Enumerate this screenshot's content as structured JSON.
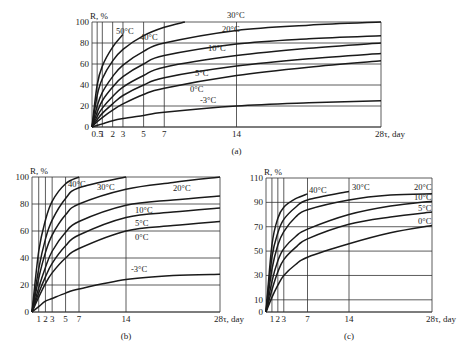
{
  "chart_data": [
    {
      "id": "a",
      "type": "line",
      "caption": "(a)",
      "ylabel": "R, %",
      "xlabel": "τ, day",
      "ylim": [
        0,
        100
      ],
      "xlim": [
        0,
        28
      ],
      "yticks": [
        0,
        20,
        40,
        60,
        80,
        100
      ],
      "xticks": [
        0.5,
        1,
        2,
        3,
        5,
        7,
        14,
        28
      ],
      "xtick_labels": [
        "0.5",
        "1",
        "2",
        "3",
        "5",
        "7",
        "14",
        "28τ, day"
      ],
      "box": {
        "x0": 92,
        "x1": 381,
        "y0": 127,
        "y1": 22
      },
      "series": [
        {
          "name": "50°C",
          "x": [
            0,
            0.5,
            1,
            2,
            3
          ],
          "values": [
            0,
            40,
            58,
            76,
            88
          ],
          "label_at": [
            116,
            34
          ]
        },
        {
          "name": "40°C",
          "x": [
            0,
            0.5,
            1,
            2,
            3,
            5,
            7,
            9
          ],
          "values": [
            0,
            30,
            46,
            63,
            74,
            87,
            95,
            100
          ],
          "label_at": [
            140,
            40
          ]
        },
        {
          "name": "30°C",
          "x": [
            0,
            0.5,
            1,
            2,
            3,
            5,
            7,
            14,
            21,
            28
          ],
          "values": [
            0,
            20,
            33,
            48,
            59,
            72,
            80,
            92,
            97,
            100
          ],
          "label_at": [
            227,
            18
          ]
        },
        {
          "name": "20°C",
          "x": [
            0,
            0.5,
            1,
            2,
            3,
            5,
            7,
            14,
            21,
            28
          ],
          "values": [
            0,
            14,
            25,
            38,
            48,
            60,
            68,
            79,
            84,
            87
          ],
          "label_at": [
            222,
            32
          ]
        },
        {
          "name": "10°C",
          "x": [
            0,
            0.5,
            1,
            2,
            3,
            5,
            7,
            14,
            21,
            28
          ],
          "values": [
            0,
            10,
            18,
            29,
            38,
            49,
            57,
            68,
            75,
            80
          ],
          "label_at": [
            208,
            51
          ]
        },
        {
          "name": "5°C",
          "x": [
            0,
            0.5,
            1,
            2,
            3,
            5,
            7,
            14,
            21,
            28
          ],
          "values": [
            0,
            7,
            13,
            22,
            30,
            40,
            47,
            58,
            65,
            70
          ],
          "label_at": [
            195,
            76
          ]
        },
        {
          "name": "0°C",
          "x": [
            0,
            0.5,
            1,
            2,
            3,
            5,
            7,
            14,
            21,
            28
          ],
          "values": [
            0,
            5,
            9,
            16,
            22,
            31,
            37,
            49,
            57,
            63
          ],
          "label_at": [
            190,
            92
          ]
        },
        {
          "name": "-3°C",
          "x": [
            0,
            1,
            2,
            3,
            5,
            7,
            14,
            21,
            28
          ],
          "values": [
            0,
            3,
            6,
            8,
            11,
            14,
            20,
            23,
            25
          ],
          "label_at": [
            200,
            103
          ]
        }
      ]
    },
    {
      "id": "b",
      "type": "line",
      "caption": "(b)",
      "ylabel": "R, %",
      "xlabel": "τ, day",
      "ylim": [
        0,
        100
      ],
      "xlim": [
        0,
        28
      ],
      "yticks": [
        0,
        20,
        40,
        60,
        80,
        100
      ],
      "xticks": [
        1,
        2,
        3,
        5,
        7,
        14,
        28
      ],
      "xtick_labels": [
        "1",
        "2",
        "3",
        "5",
        "7",
        "14",
        "28τ, day"
      ],
      "box": {
        "x0": 32,
        "x1": 220,
        "y0": 312,
        "y1": 177
      },
      "series": [
        {
          "name": "40°C",
          "x": [
            0,
            1,
            2,
            3,
            5,
            7
          ],
          "values": [
            0,
            45,
            68,
            82,
            95,
            100
          ],
          "label_at": [
            68,
            187
          ]
        },
        {
          "name": "30°C",
          "x": [
            0,
            1,
            2,
            3,
            5,
            7,
            14
          ],
          "values": [
            0,
            32,
            54,
            68,
            84,
            92,
            100
          ],
          "label_at": [
            97,
            190
          ]
        },
        {
          "name": "20°C",
          "x": [
            0,
            1,
            2,
            3,
            5,
            7,
            14,
            21,
            28
          ],
          "values": [
            0,
            25,
            44,
            57,
            72,
            80,
            91,
            96,
            100
          ],
          "label_at": [
            173,
            191
          ]
        },
        {
          "name": "10°C",
          "x": [
            0,
            1,
            2,
            3,
            5,
            7,
            14,
            21,
            28
          ],
          "values": [
            0,
            18,
            33,
            45,
            59,
            67,
            79,
            83,
            86
          ],
          "label_at": [
            135,
            213
          ]
        },
        {
          "name": "5°C",
          "x": [
            0,
            1,
            2,
            3,
            5,
            7,
            14,
            21,
            28
          ],
          "values": [
            0,
            14,
            26,
            36,
            49,
            57,
            70,
            74,
            77
          ],
          "label_at": [
            135,
            226
          ]
        },
        {
          "name": "0°C",
          "x": [
            0,
            1,
            2,
            3,
            5,
            7,
            14,
            21,
            28
          ],
          "values": [
            0,
            11,
            21,
            29,
            40,
            47,
            60,
            64,
            67
          ],
          "label_at": [
            135,
            240
          ]
        },
        {
          "name": "-3°C",
          "x": [
            0,
            1,
            2,
            3,
            5,
            7,
            14,
            21,
            28
          ],
          "values": [
            0,
            4,
            8,
            10,
            14,
            17,
            24,
            27,
            28
          ],
          "label_at": [
            131,
            272
          ]
        }
      ]
    },
    {
      "id": "c",
      "type": "line",
      "caption": "(c)",
      "ylabel": "R, %",
      "xlabel": "τ, day",
      "ylim": [
        0,
        110
      ],
      "xlim": [
        0,
        28
      ],
      "yticks": [
        0,
        10,
        30,
        50,
        70,
        90,
        110
      ],
      "xticks": [
        1,
        2,
        3,
        7,
        14,
        28
      ],
      "xtick_labels": [
        "1",
        "2",
        "3",
        "7",
        "14",
        "28τ, day"
      ],
      "box": {
        "x0": 266,
        "x1": 432,
        "y0": 312,
        "y1": 178
      },
      "series": [
        {
          "name": "40°C",
          "x": [
            0,
            1,
            2,
            3,
            5,
            7
          ],
          "values": [
            0,
            55,
            77,
            86,
            93,
            97
          ],
          "label_at": [
            309,
            193
          ]
        },
        {
          "name": "30°C",
          "x": [
            0,
            1,
            2,
            3,
            5,
            7,
            14
          ],
          "values": [
            0,
            45,
            65,
            76,
            86,
            92,
            99
          ],
          "label_at": [
            352,
            190
          ]
        },
        {
          "name": "20°C",
          "x": [
            0,
            1,
            2,
            3,
            5,
            7,
            14,
            21,
            28
          ],
          "values": [
            0,
            35,
            55,
            66,
            78,
            84,
            92,
            96,
            97
          ],
          "label_at": [
            414,
            190
          ]
        },
        {
          "name": "10°C",
          "x": [
            0,
            1,
            2,
            3,
            5,
            7,
            14,
            21,
            28
          ],
          "values": [
            0,
            25,
            42,
            52,
            62,
            68,
            80,
            87,
            91
          ],
          "label_at": [
            414,
            200
          ]
        },
        {
          "name": "5°C",
          "x": [
            0,
            1,
            2,
            3,
            5,
            7,
            14,
            21,
            28
          ],
          "values": [
            0,
            18,
            33,
            43,
            53,
            60,
            72,
            78,
            82
          ],
          "label_at": [
            418,
            211
          ]
        },
        {
          "name": "0°C",
          "x": [
            0,
            1,
            2,
            3,
            5,
            7,
            14,
            21,
            28
          ],
          "values": [
            0,
            12,
            22,
            30,
            39,
            45,
            56,
            65,
            71
          ],
          "label_at": [
            418,
            224
          ]
        }
      ]
    }
  ]
}
